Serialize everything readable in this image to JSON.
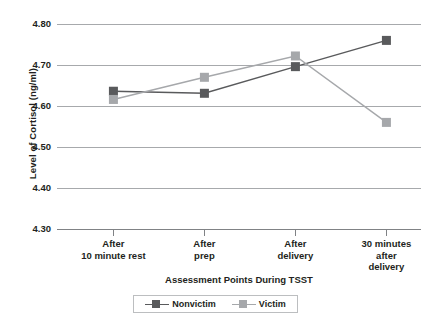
{
  "chart_data": {
    "type": "line",
    "title": "",
    "xlabel": "Assessment Points During TSST",
    "ylabel": "Level of Cortisol (ng/ml)",
    "categories": [
      "After\n10 minute rest",
      "After\nprep",
      "After\ndelivery",
      "30 minutes\nafter\ndelivery"
    ],
    "category_lines": [
      [
        "After",
        "10 minute rest"
      ],
      [
        "After",
        "prep"
      ],
      [
        "After",
        "delivery"
      ],
      [
        "30 minutes",
        "after",
        "delivery"
      ]
    ],
    "series": [
      {
        "name": "Nonvictim",
        "color": "#595a5c",
        "values": [
          4.636,
          4.631,
          4.696,
          4.76
        ]
      },
      {
        "name": "Victim",
        "color": "#a6a8ab",
        "values": [
          4.616,
          4.67,
          4.722,
          4.56
        ]
      }
    ],
    "ylim": [
      4.3,
      4.8
    ],
    "yticks": [
      4.8,
      4.7,
      4.6,
      4.5,
      4.4,
      4.3
    ],
    "ytick_labels": [
      "4.80",
      "4.70",
      "4.60",
      "4.50",
      "4.40",
      "4.30"
    ],
    "grid": true,
    "legend_position": "bottom",
    "legend_entries": [
      "Nonvictim",
      "Victim"
    ]
  },
  "colors": {
    "nonvictim": "#595a5c",
    "victim": "#a6a8ab",
    "gridline": "#a7a9ac",
    "text": "#231f20",
    "legend_border": "#bcbec0"
  }
}
